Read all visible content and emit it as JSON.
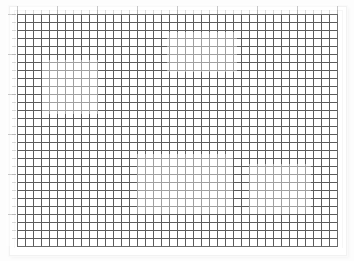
{
  "canvas": {
    "name": "grid-paper-canvas",
    "width_px": 354,
    "height_px": 261,
    "background_color": "#ffffff",
    "page_color": "#ffffff",
    "grid": {
      "line_color": "#5c5c5c",
      "cell_size_px": 8,
      "columns": 40,
      "rows": 29,
      "origin_x_px": 17,
      "origin_y_px": 14,
      "width_px": 320,
      "height_px": 232,
      "border_color": "#6a6a6a"
    }
  },
  "rulers": {
    "top": {
      "label": "horizontal-ruler",
      "minor_tick_spacing_px": 8,
      "major_tick_spacing_px": 40,
      "tick_color": "#b9b9b9",
      "major_tick_color": "#8e8e8e"
    },
    "left": {
      "label": "vertical-ruler",
      "minor_tick_spacing_px": 8,
      "major_tick_spacing_px": 40,
      "tick_color": "#b9b9b9",
      "major_tick_color": "#8e8e8e"
    }
  },
  "sheet": {
    "name": "page-sheet",
    "border_color": "#f2f2f2",
    "shadow": "2px 2px 3px rgba(0,0,0,0.04)"
  }
}
